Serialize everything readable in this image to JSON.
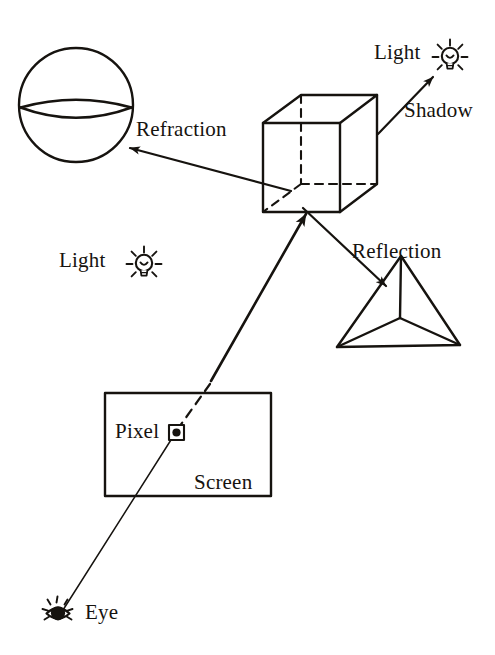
{
  "diagram": {
    "background_color": "#ffffff",
    "ink_color": "#16130f",
    "width": 495,
    "height": 655
  },
  "labels": {
    "refraction": "Refraction",
    "shadow": "Shadow",
    "reflection": "Reflection",
    "light_top": "Light",
    "light_middle": "Light",
    "pixel": "Pixel",
    "screen": "Screen",
    "eye": "Eye"
  },
  "objects": {
    "sphere": {
      "name": "sphere",
      "cx": 76,
      "cy": 105,
      "r": 57
    },
    "cube": {
      "name": "cube",
      "front_top_left": [
        263,
        123
      ],
      "front_top_right": [
        340,
        123
      ],
      "front_bottom_left": [
        263,
        212
      ],
      "front_bottom_right": [
        340,
        212
      ],
      "back_top_left": [
        301,
        95
      ],
      "back_top_right": [
        377,
        95
      ],
      "back_bottom_left": [
        301,
        184
      ],
      "back_bottom_right": [
        377,
        184
      ]
    },
    "tetrahedron": {
      "name": "tetrahedron",
      "apex": [
        401,
        256
      ],
      "bottom_left": [
        337,
        347
      ],
      "bottom_right": [
        460,
        345
      ],
      "inner_vertex": [
        400,
        318
      ]
    },
    "screen": {
      "name": "screen",
      "x": 105,
      "y": 393,
      "width": 166,
      "height": 103
    },
    "pixel_marker": {
      "name": "pixel",
      "cx": 176,
      "cy": 432,
      "size": 15
    },
    "eye": {
      "name": "eye",
      "cx": 58,
      "cy": 613
    },
    "light_top": {
      "name": "light-bulb",
      "cx": 450,
      "cy": 57
    },
    "light_middle": {
      "name": "light-bulb",
      "cx": 144,
      "cy": 264
    }
  },
  "rays": {
    "eye_to_pixel": {
      "from": [
        62,
        611
      ],
      "to": [
        176,
        432
      ],
      "style": "thin-solid"
    },
    "pixel_through_screen": {
      "from": [
        176,
        432
      ],
      "to": [
        209,
        384
      ],
      "style": "dashed"
    },
    "screen_to_cube": {
      "from": [
        210,
        383
      ],
      "to": [
        305,
        212
      ],
      "style": "thick-arrow",
      "arrow_at": "cube"
    },
    "refraction_ray": {
      "from": [
        290,
        191
      ],
      "to": [
        128,
        148
      ],
      "style": "arrow",
      "arrow_at": "sphere"
    },
    "reflection_ray": {
      "from": [
        304,
        209
      ],
      "to": [
        387,
        287
      ],
      "style": "arrow",
      "arrow_at": "tetrahedron"
    },
    "shadow_ray": {
      "from": [
        378,
        134
      ],
      "to": [
        434,
        76
      ],
      "style": "arrow",
      "arrow_at": "light_top"
    }
  }
}
